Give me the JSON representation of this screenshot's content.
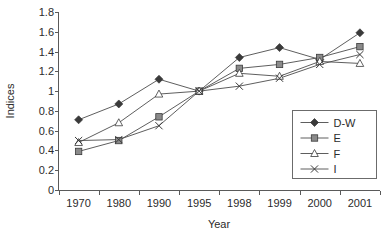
{
  "chart_data": {
    "type": "line",
    "title": "",
    "xlabel": "Year",
    "ylabel": "Indices",
    "categories": [
      "1970",
      "1980",
      "1990",
      "1995",
      "1998",
      "1999",
      "2000",
      "2001"
    ],
    "ylim": [
      0,
      1.8
    ],
    "yticks": [
      "0",
      "0.2",
      "0.4",
      "0.6",
      "0.8",
      "1",
      "1.2",
      "1.4",
      "1.6",
      "1.8"
    ],
    "ytick_values": [
      0,
      0.2,
      0.4,
      0.6,
      0.8,
      1.0,
      1.2,
      1.4,
      1.6,
      1.8
    ],
    "grid": false,
    "legend_position": "inside-bottom-right",
    "series": [
      {
        "name": "D-W",
        "marker": "filled-diamond",
        "values": [
          0.71,
          0.87,
          1.12,
          1.0,
          1.34,
          1.44,
          1.32,
          1.59
        ]
      },
      {
        "name": "E",
        "marker": "filled-square",
        "values": [
          0.39,
          0.5,
          0.74,
          1.0,
          1.23,
          1.27,
          1.34,
          1.45
        ]
      },
      {
        "name": "F",
        "marker": "open-triangle",
        "values": [
          0.48,
          0.68,
          0.97,
          1.0,
          1.18,
          1.15,
          1.3,
          1.28
        ]
      },
      {
        "name": "I",
        "marker": "cross",
        "values": [
          0.5,
          0.51,
          0.65,
          1.0,
          1.05,
          1.13,
          1.27,
          1.37
        ]
      }
    ]
  },
  "colors": {
    "axis": "#5a5a5a",
    "text": "#2b2b2b",
    "line": "#4c4c4c",
    "marker_fill_dark": "#3a3a3a",
    "marker_fill_mid": "#8a8a8a",
    "background": "#ffffff"
  },
  "legend": {
    "items": [
      {
        "label": "D-W",
        "marker": "filled-diamond"
      },
      {
        "label": "E",
        "marker": "filled-square"
      },
      {
        "label": "F",
        "marker": "open-triangle"
      },
      {
        "label": "I",
        "marker": "cross"
      }
    ]
  }
}
